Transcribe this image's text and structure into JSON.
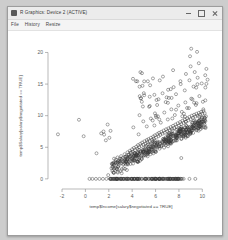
{
  "window": {
    "title": "R Graphics: Device 2 (ACTIVE)",
    "icon": "r-graphics-icon",
    "controls": {
      "minimize": "–",
      "maximize": "□",
      "close": "✕"
    }
  },
  "menubar": {
    "items": [
      {
        "label": "File"
      },
      {
        "label": "History"
      },
      {
        "label": "Resize"
      }
    ]
  },
  "colors": {
    "window_background": "#f4f4f4",
    "titlebar": "#ececec",
    "plot_background": "#ffffff",
    "point_stroke": "#3a3a3a",
    "axis": "#8a8a8a",
    "desktop": "#cdcdcd"
  },
  "chart_data": {
    "type": "scatter",
    "title": "",
    "xlabel": "temp$Income[salary$negotiated == TRUE]",
    "ylabel": "temp$Salary[salary$negotiated == TRUE]",
    "xlim": [
      -3.2,
      11.0
    ],
    "ylim": [
      -1.6,
      21.5
    ],
    "xticks": [
      -2,
      0,
      2,
      4,
      6,
      8,
      10
    ],
    "yticks": [
      0,
      5,
      10,
      15,
      20
    ],
    "grid": false,
    "legend": null,
    "marker": "open-circle",
    "marker_size": 1.5,
    "n_points": 620,
    "points": [
      [
        -2.35,
        7.05
      ],
      [
        -0.55,
        9.35
      ],
      [
        -0.15,
        6.75
      ],
      [
        0.95,
        4.05
      ],
      [
        1.35,
        7.2
      ],
      [
        1.55,
        7.5
      ],
      [
        1.6,
        7.0
      ],
      [
        1.75,
        6.1
      ],
      [
        1.9,
        8.6
      ],
      [
        2.05,
        6.5
      ],
      [
        2.15,
        7.6
      ],
      [
        2.3,
        2.35
      ],
      [
        2.45,
        3.2
      ],
      [
        2.6,
        3.05
      ],
      [
        2.75,
        3.4
      ],
      [
        2.9,
        2.85
      ],
      [
        3.05,
        3.6
      ],
      [
        3.2,
        3.3
      ],
      [
        3.35,
        3.9
      ],
      [
        3.5,
        3.55
      ],
      [
        3.6,
        4.2
      ],
      [
        3.7,
        3.85
      ],
      [
        3.8,
        4.45
      ],
      [
        3.9,
        4.1
      ],
      [
        4.0,
        4.7
      ],
      [
        4.05,
        4.3
      ],
      [
        4.15,
        4.9
      ],
      [
        4.25,
        4.55
      ],
      [
        4.35,
        5.1
      ],
      [
        4.45,
        4.75
      ],
      [
        4.5,
        5.35
      ],
      [
        4.6,
        5.0
      ],
      [
        4.7,
        5.55
      ],
      [
        4.8,
        5.2
      ],
      [
        4.85,
        5.75
      ],
      [
        4.95,
        5.4
      ],
      [
        5.05,
        5.95
      ],
      [
        5.15,
        5.6
      ],
      [
        5.25,
        6.15
      ],
      [
        5.3,
        5.8
      ],
      [
        5.4,
        6.3
      ],
      [
        5.5,
        6.0
      ],
      [
        5.6,
        6.5
      ],
      [
        5.7,
        6.2
      ],
      [
        5.8,
        6.7
      ],
      [
        5.85,
        6.35
      ],
      [
        5.95,
        6.9
      ],
      [
        6.05,
        6.55
      ],
      [
        6.15,
        7.1
      ],
      [
        6.25,
        6.75
      ],
      [
        6.3,
        7.3
      ],
      [
        6.4,
        6.95
      ],
      [
        6.5,
        7.45
      ],
      [
        6.6,
        7.15
      ],
      [
        6.7,
        7.65
      ],
      [
        6.8,
        7.3
      ],
      [
        6.9,
        7.85
      ],
      [
        7.0,
        7.5
      ],
      [
        7.1,
        8.0
      ],
      [
        7.2,
        7.7
      ],
      [
        7.3,
        8.2
      ],
      [
        7.4,
        7.9
      ],
      [
        7.5,
        8.4
      ],
      [
        7.6,
        8.05
      ],
      [
        7.7,
        8.6
      ],
      [
        7.8,
        8.25
      ],
      [
        7.9,
        8.8
      ],
      [
        8.0,
        8.45
      ],
      [
        8.1,
        9.0
      ],
      [
        8.2,
        8.65
      ],
      [
        8.3,
        9.2
      ],
      [
        8.4,
        8.85
      ],
      [
        8.5,
        9.4
      ],
      [
        8.6,
        9.05
      ],
      [
        8.7,
        9.6
      ],
      [
        8.8,
        9.25
      ],
      [
        8.9,
        9.8
      ],
      [
        9.0,
        9.45
      ],
      [
        9.1,
        10.0
      ],
      [
        9.2,
        9.65
      ],
      [
        9.3,
        10.15
      ],
      [
        9.4,
        9.85
      ],
      [
        9.5,
        10.3
      ],
      [
        9.6,
        10.0
      ],
      [
        9.7,
        10.45
      ],
      [
        9.8,
        10.15
      ],
      [
        9.9,
        10.6
      ],
      [
        10.0,
        10.3
      ],
      [
        10.1,
        10.75
      ],
      [
        10.2,
        10.4
      ],
      [
        4.1,
        8.15
      ],
      [
        4.55,
        7.05
      ],
      [
        4.95,
        9.1
      ],
      [
        5.25,
        8.3
      ],
      [
        5.6,
        9.55
      ],
      [
        5.9,
        8.45
      ],
      [
        6.2,
        9.9
      ],
      [
        6.45,
        8.9
      ],
      [
        6.75,
        10.5
      ],
      [
        7.05,
        9.4
      ],
      [
        7.35,
        11.0
      ],
      [
        7.65,
        10.1
      ],
      [
        7.95,
        11.6
      ],
      [
        8.25,
        10.6
      ],
      [
        8.55,
        12.1
      ],
      [
        8.85,
        11.2
      ],
      [
        9.15,
        12.6
      ],
      [
        9.45,
        11.7
      ],
      [
        9.75,
        13.1
      ],
      [
        10.05,
        12.2
      ],
      [
        5.5,
        13.0
      ],
      [
        5.9,
        13.3
      ],
      [
        6.25,
        12.6
      ],
      [
        6.6,
        13.55
      ],
      [
        6.95,
        12.9
      ],
      [
        7.3,
        14.2
      ],
      [
        7.75,
        13.4
      ],
      [
        8.15,
        15.0
      ],
      [
        8.5,
        14.0
      ],
      [
        8.9,
        15.6
      ],
      [
        9.25,
        14.6
      ],
      [
        9.6,
        16.0
      ],
      [
        9.95,
        15.1
      ],
      [
        10.25,
        16.4
      ],
      [
        7.5,
        17.2
      ],
      [
        8.6,
        16.6
      ],
      [
        9.0,
        17.8
      ],
      [
        9.35,
        16.9
      ],
      [
        9.7,
        18.3
      ],
      [
        8.95,
        19.4
      ],
      [
        9.55,
        20.1
      ],
      [
        9.05,
        20.6
      ],
      [
        10.35,
        17.4
      ],
      [
        10.45,
        15.7
      ],
      [
        2.4,
        1.05
      ],
      [
        3.1,
        0.9
      ],
      [
        3.55,
        1.4
      ],
      [
        1.95,
        0.6
      ],
      [
        8.2,
        3.3
      ],
      [
        0.35,
        0.0
      ],
      [
        0.6,
        0.0
      ],
      [
        0.9,
        0.0
      ],
      [
        1.2,
        0.0
      ],
      [
        1.5,
        0.0
      ],
      [
        1.8,
        0.0
      ],
      [
        2.1,
        0.0
      ],
      [
        2.4,
        0.0
      ],
      [
        2.7,
        0.0
      ],
      [
        3.0,
        0.0
      ],
      [
        3.3,
        0.0
      ],
      [
        3.6,
        0.0
      ],
      [
        3.9,
        0.0
      ],
      [
        4.2,
        0.0
      ],
      [
        4.5,
        0.0
      ],
      [
        4.8,
        0.0
      ],
      [
        5.1,
        0.0
      ],
      [
        5.4,
        0.0
      ],
      [
        5.7,
        0.0
      ],
      [
        6.0,
        0.0
      ],
      [
        6.3,
        0.0
      ],
      [
        6.6,
        0.0
      ],
      [
        6.9,
        0.0
      ],
      [
        7.2,
        0.0
      ],
      [
        7.5,
        0.0
      ],
      [
        7.9,
        0.0
      ],
      [
        8.4,
        0.0
      ],
      [
        8.9,
        0.0
      ],
      [
        9.4,
        0.0
      ]
    ]
  }
}
